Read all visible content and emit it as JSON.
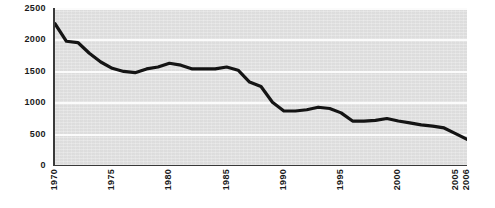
{
  "chart_data": {
    "type": "line",
    "title": "",
    "subtitle": "",
    "xlabel": "",
    "ylabel": "",
    "xlim": [
      1970,
      2006
    ],
    "ylim": [
      0,
      2500
    ],
    "grid": true,
    "legend": "none",
    "colors": {
      "line": "#141414",
      "plot_background": "#e3e3e3",
      "gridline": "#fbfbfb",
      "axis": "#3a3a3a",
      "text": "#1a1a1a"
    },
    "y_ticks": [
      0,
      500,
      1000,
      1500,
      2000,
      2500
    ],
    "y_tick_labels": [
      "0",
      "500",
      "1000",
      "1500",
      "2000",
      "2500"
    ],
    "x_ticks": [
      1970,
      1975,
      1980,
      1985,
      1990,
      1995,
      2000,
      2005,
      2006
    ],
    "x_tick_labels": [
      "1970",
      "1975",
      "1980",
      "1985",
      "1990",
      "1995",
      "2000",
      "2005",
      "2006"
    ],
    "series": [
      {
        "name": "value",
        "x": [
          1970,
          1971,
          1972,
          1973,
          1974,
          1975,
          1976,
          1977,
          1978,
          1979,
          1980,
          1981,
          1982,
          1983,
          1984,
          1985,
          1986,
          1987,
          1988,
          1989,
          1990,
          1991,
          1992,
          1993,
          1994,
          1995,
          1996,
          1997,
          1998,
          1999,
          2000,
          2001,
          2002,
          2003,
          2004,
          2005,
          2006
        ],
        "values": [
          2250,
          1970,
          1950,
          1780,
          1640,
          1540,
          1490,
          1470,
          1530,
          1560,
          1620,
          1590,
          1530,
          1530,
          1530,
          1560,
          1510,
          1320,
          1250,
          1000,
          860,
          860,
          880,
          920,
          900,
          830,
          700,
          700,
          710,
          740,
          700,
          670,
          640,
          620,
          590,
          500,
          410
        ]
      }
    ]
  }
}
